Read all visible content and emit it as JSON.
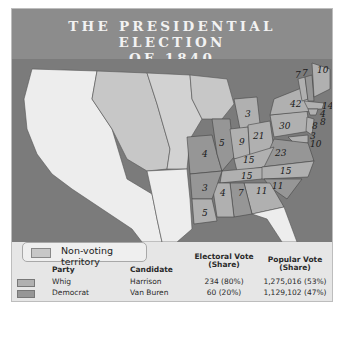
{
  "title": {
    "line1": "THE PRESIDENTIAL ELECTION",
    "line2": "OF 1840"
  },
  "colors": {
    "header": "#8c8c8c",
    "water": "#7b7b7b",
    "west_unorganized": "#ededed",
    "non_voting_territory": "#c7c7c7",
    "whig": "#b0b0b0",
    "democrat": "#969696"
  },
  "map": {
    "states": [
      {
        "name": "Maine",
        "ev": "10",
        "party": "whig"
      },
      {
        "name": "New Hampshire",
        "ev": "7",
        "party": "democrat"
      },
      {
        "name": "Vermont",
        "ev": "7",
        "party": "whig"
      },
      {
        "name": "Massachusetts",
        "ev": "14",
        "party": "whig"
      },
      {
        "name": "Rhode Island",
        "ev": "4",
        "party": "whig"
      },
      {
        "name": "Connecticut",
        "ev": "8",
        "party": "whig"
      },
      {
        "name": "New York",
        "ev": "42",
        "party": "whig"
      },
      {
        "name": "New Jersey",
        "ev": "8",
        "party": "whig"
      },
      {
        "name": "Delaware",
        "ev": "3",
        "party": "whig"
      },
      {
        "name": "Maryland",
        "ev": "10",
        "party": "whig"
      },
      {
        "name": "Pennsylvania",
        "ev": "30",
        "party": "whig"
      },
      {
        "name": "Michigan",
        "ev": "3",
        "party": "whig"
      },
      {
        "name": "Ohio",
        "ev": "21",
        "party": "whig"
      },
      {
        "name": "Indiana",
        "ev": "9",
        "party": "whig"
      },
      {
        "name": "Illinois",
        "ev": "5",
        "party": "democrat"
      },
      {
        "name": "Missouri",
        "ev": "4",
        "party": "democrat"
      },
      {
        "name": "Kentucky",
        "ev": "15",
        "party": "whig"
      },
      {
        "name": "Virginia",
        "ev": "23",
        "party": "democrat"
      },
      {
        "name": "Tennessee",
        "ev": "15",
        "party": "whig"
      },
      {
        "name": "North Carolina",
        "ev": "15",
        "party": "whig"
      },
      {
        "name": "South Carolina",
        "ev": "11",
        "party": "democrat"
      },
      {
        "name": "Georgia",
        "ev": "11",
        "party": "whig"
      },
      {
        "name": "Alabama",
        "ev": "7",
        "party": "democrat"
      },
      {
        "name": "Mississippi",
        "ev": "4",
        "party": "whig"
      },
      {
        "name": "Arkansas",
        "ev": "3",
        "party": "democrat"
      },
      {
        "name": "Louisiana",
        "ev": "5",
        "party": "whig"
      }
    ],
    "non_voting_legend": "Non-voting territory"
  },
  "legend": {
    "headers": {
      "party": "Party",
      "candidate": "Candidate",
      "electoral_1": "Electoral Vote",
      "electoral_2": "(Share)",
      "popular_1": "Popular Vote",
      "popular_2": "(Share)"
    },
    "rows": [
      {
        "party": "Whig",
        "candidate": "Harrison",
        "electoral": "234 (80%)",
        "popular": "1,275,016 (53%)"
      },
      {
        "party": "Democrat",
        "candidate": "Van Buren",
        "electoral": "60 (20%)",
        "popular": "1,129,102 (47%)"
      }
    ]
  }
}
